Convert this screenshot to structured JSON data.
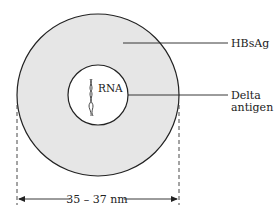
{
  "diagram": {
    "labels": {
      "envelope": "HBsAg",
      "core_line1": "Delta",
      "core_line2": "antigen",
      "genome": "RNA",
      "diameter": "35 – 37 nm"
    },
    "colors": {
      "envelope_fill": "#e6e6e6",
      "core_fill": "#ffffff",
      "stroke": "#222222"
    }
  }
}
